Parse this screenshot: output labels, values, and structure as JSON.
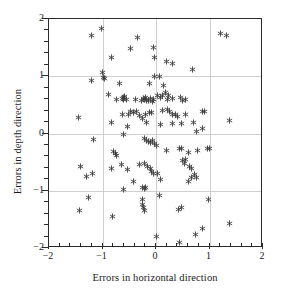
{
  "chart_data": {
    "type": "scatter",
    "title": "",
    "xlabel": "Errors in horizontal direction",
    "ylabel": "Errors in depth direction",
    "xlim": [
      -2,
      2
    ],
    "ylim": [
      -2,
      2
    ],
    "xticks": [
      -2,
      -1,
      0,
      1,
      2
    ],
    "yticks": [
      -2,
      -1,
      0,
      1,
      2
    ],
    "xtick_labels": [
      "−2",
      "−1",
      "0",
      "1",
      "2"
    ],
    "ytick_labels": [
      "−2",
      "−1",
      "0",
      "1",
      "2"
    ],
    "minor_tick_step": 0.2,
    "grid": true,
    "grid_color": "#cfcfcf",
    "marker": "asterisk",
    "marker_color": "#3a3a3a",
    "axis_color": "#2b2b2b",
    "background": "#ffffff",
    "legend": null,
    "n_points": 139,
    "points": [
      [
        -1.21,
        1.72
      ],
      [
        -1.01,
        1.83
      ],
      [
        -0.47,
        1.49
      ],
      [
        -0.34,
        1.68
      ],
      [
        -0.05,
        1.51
      ],
      [
        1.2,
        1.75
      ],
      [
        1.32,
        1.72
      ],
      [
        -0.83,
        1.33
      ],
      [
        -0.02,
        1.32
      ],
      [
        0.2,
        1.25
      ],
      [
        0.3,
        1.23
      ],
      [
        0.69,
        1.12
      ],
      [
        -1.0,
        1.06
      ],
      [
        -1.21,
        0.92
      ],
      [
        -0.99,
        0.97
      ],
      [
        -0.97,
        0.96
      ],
      [
        -0.02,
        1.0
      ],
      [
        0.06,
        1.0
      ],
      [
        -0.13,
        0.88
      ],
      [
        -0.69,
        0.88
      ],
      [
        0.14,
        0.84
      ],
      [
        -0.88,
        0.68
      ],
      [
        -0.73,
        0.6
      ],
      [
        -0.63,
        0.62
      ],
      [
        -0.61,
        0.63
      ],
      [
        -0.6,
        0.6
      ],
      [
        -0.59,
        0.64
      ],
      [
        -0.55,
        0.6
      ],
      [
        -0.39,
        0.59
      ],
      [
        -0.28,
        0.57
      ],
      [
        -0.24,
        0.62
      ],
      [
        -0.22,
        0.6
      ],
      [
        -0.2,
        0.63
      ],
      [
        -0.18,
        0.58
      ],
      [
        -0.14,
        0.57
      ],
      [
        -0.1,
        0.62
      ],
      [
        -0.07,
        0.56
      ],
      [
        -0.05,
        0.6
      ],
      [
        0.02,
        0.66
      ],
      [
        0.09,
        0.63
      ],
      [
        0.12,
        0.67
      ],
      [
        0.17,
        0.72
      ],
      [
        0.21,
        0.6
      ],
      [
        0.24,
        0.66
      ],
      [
        0.3,
        0.61
      ],
      [
        0.46,
        0.63
      ],
      [
        0.5,
        0.57
      ],
      [
        0.56,
        0.59
      ],
      [
        -1.45,
        0.28
      ],
      [
        -0.84,
        0.2
      ],
      [
        -0.63,
        0.34
      ],
      [
        -0.52,
        0.33
      ],
      [
        -0.47,
        0.38
      ],
      [
        -0.42,
        0.36
      ],
      [
        -0.36,
        0.38
      ],
      [
        -0.3,
        0.31
      ],
      [
        -0.25,
        0.26
      ],
      [
        -0.19,
        0.34
      ],
      [
        -0.12,
        0.37
      ],
      [
        -0.08,
        0.36
      ],
      [
        0.13,
        0.4
      ],
      [
        0.22,
        0.42
      ],
      [
        0.26,
        0.38
      ],
      [
        0.3,
        0.33
      ],
      [
        0.36,
        0.33
      ],
      [
        0.41,
        0.29
      ],
      [
        0.55,
        0.34
      ],
      [
        0.86,
        0.38
      ],
      [
        0.9,
        0.38
      ],
      [
        1.38,
        0.22
      ],
      [
        -0.54,
        0.12
      ],
      [
        -0.18,
        0.19
      ],
      [
        0.09,
        0.15
      ],
      [
        0.31,
        0.18
      ],
      [
        0.47,
        0.17
      ],
      [
        0.7,
        0.2
      ],
      [
        0.76,
        0.03
      ],
      [
        0.87,
        0.08
      ],
      [
        -1.17,
        -0.11
      ],
      [
        -0.61,
        -0.02
      ],
      [
        -0.21,
        -0.08
      ],
      [
        -0.18,
        -0.12
      ],
      [
        -0.14,
        -0.14
      ],
      [
        -0.11,
        -0.16
      ],
      [
        -0.06,
        -0.12
      ],
      [
        -0.03,
        -0.17
      ],
      [
        0.0,
        -0.21
      ],
      [
        -0.8,
        -0.31
      ],
      [
        -0.76,
        -0.35
      ],
      [
        -0.73,
        -0.38
      ],
      [
        0.2,
        -0.29
      ],
      [
        0.43,
        -0.26
      ],
      [
        0.47,
        -0.26
      ],
      [
        0.6,
        -0.34
      ],
      [
        0.78,
        -0.29
      ],
      [
        0.97,
        -0.27
      ],
      [
        1.0,
        -0.27
      ],
      [
        -1.42,
        -0.58
      ],
      [
        -1.3,
        -0.75
      ],
      [
        -1.19,
        -0.7
      ],
      [
        -0.83,
        -0.62
      ],
      [
        -0.65,
        -0.55
      ],
      [
        -0.54,
        -0.63
      ],
      [
        -0.31,
        -0.55
      ],
      [
        -0.21,
        -0.52
      ],
      [
        -0.16,
        -0.57
      ],
      [
        -0.11,
        -0.62
      ],
      [
        -0.08,
        -0.66
      ],
      [
        -0.05,
        -0.7
      ],
      [
        0.02,
        -0.7
      ],
      [
        0.5,
        -0.47
      ],
      [
        0.54,
        -0.52
      ],
      [
        0.56,
        -0.46
      ],
      [
        0.62,
        -0.58
      ],
      [
        0.66,
        -0.62
      ],
      [
        0.72,
        -0.72
      ],
      [
        0.75,
        -0.77
      ],
      [
        -0.42,
        -0.84
      ],
      [
        0.09,
        -0.8
      ],
      [
        0.6,
        -0.83
      ],
      [
        0.66,
        -0.76
      ],
      [
        -0.6,
        -0.98
      ],
      [
        -0.25,
        -0.95
      ],
      [
        -0.22,
        -0.96
      ],
      [
        -0.19,
        -0.95
      ],
      [
        0.06,
        -1.08
      ],
      [
        -1.27,
        -1.12
      ],
      [
        -0.26,
        -1.16
      ],
      [
        -0.25,
        -1.24
      ],
      [
        -0.24,
        -1.3
      ],
      [
        -0.22,
        -1.35
      ],
      [
        0.98,
        -1.15
      ],
      [
        -1.43,
        -1.34
      ],
      [
        -0.82,
        -1.45
      ],
      [
        0.42,
        -1.33
      ],
      [
        0.48,
        -1.29
      ],
      [
        0.87,
        -1.66
      ],
      [
        1.38,
        -1.58
      ],
      [
        0.73,
        -1.77
      ],
      [
        0.0,
        -1.8
      ],
      [
        0.44,
        -1.91
      ]
    ]
  }
}
